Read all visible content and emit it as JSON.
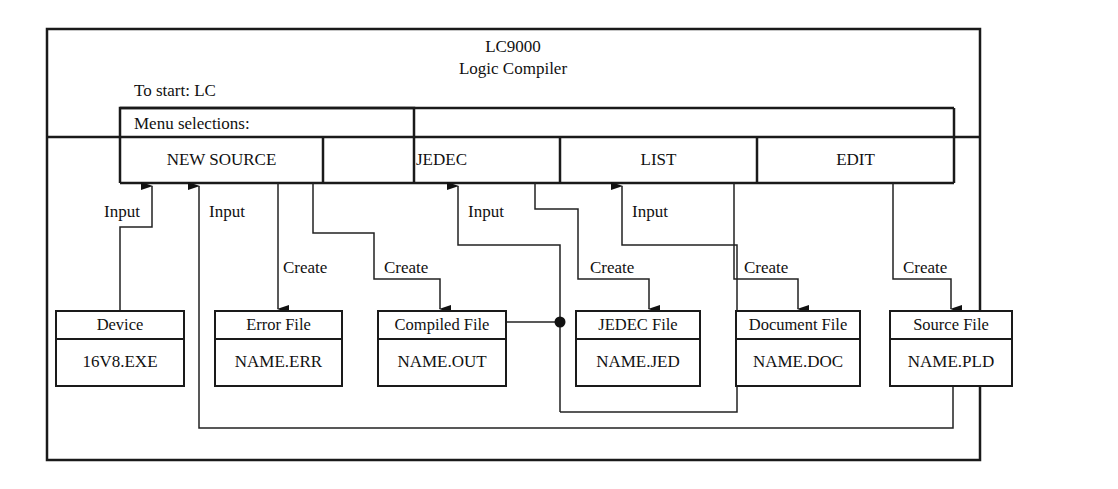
{
  "header": {
    "title": "LC9000",
    "subtitle": "Logic Compiler",
    "start_instruction": "To start: LC"
  },
  "menu": {
    "label": "Menu selections:",
    "items": [
      {
        "label": "NEW SOURCE"
      },
      {
        "label": "JEDEC"
      },
      {
        "label": "LIST"
      },
      {
        "label": "EDIT"
      }
    ]
  },
  "files": [
    {
      "title": "Device",
      "name": "16V8.EXE"
    },
    {
      "title": "Error File",
      "name": "NAME.ERR"
    },
    {
      "title": "Compiled File",
      "name": "NAME.OUT"
    },
    {
      "title": "JEDEC File",
      "name": "NAME.JED"
    },
    {
      "title": "Document File",
      "name": "NAME.DOC"
    },
    {
      "title": "Source File",
      "name": "NAME.PLD"
    }
  ],
  "connections": {
    "input_label": "Input",
    "create_label": "Create",
    "flows": [
      {
        "from": "Device",
        "to": "NEW SOURCE",
        "label": "Input"
      },
      {
        "from": "Source File",
        "to": "NEW SOURCE",
        "label": "Input"
      },
      {
        "from": "NEW SOURCE",
        "to": "Error File",
        "label": "Create"
      },
      {
        "from": "NEW SOURCE",
        "to": "Compiled File",
        "label": "Create"
      },
      {
        "from": "Compiled File",
        "to": "JEDEC",
        "label": "Input"
      },
      {
        "from": "JEDEC",
        "to": "JEDEC File",
        "label": "Create"
      },
      {
        "from": "Compiled File",
        "to": "LIST",
        "label": "Input"
      },
      {
        "from": "LIST",
        "to": "Document File",
        "label": "Create"
      },
      {
        "from": "EDIT",
        "to": "Source File",
        "label": "Create"
      }
    ]
  },
  "labels": {
    "input_1": "Input",
    "input_2": "Input",
    "input_3": "Input",
    "input_4": "Input",
    "create_1": "Create",
    "create_2": "Create",
    "create_3": "Create",
    "create_4": "Create",
    "create_5": "Create"
  }
}
